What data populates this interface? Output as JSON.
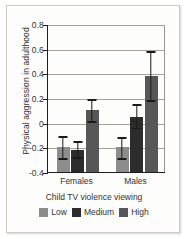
{
  "chart_data": {
    "type": "bar",
    "title": "",
    "xlabel": "Child TV violence viewing",
    "ylabel": "Physical aggression in adulthood",
    "categories": [
      "Females",
      "Males"
    ],
    "ylim": [
      -0.4,
      0.8
    ],
    "yticks": [
      "0.8",
      "0.6",
      "0.4",
      "0.2",
      "0",
      "-0.2",
      "-0.4"
    ],
    "ytick_values": [
      0.8,
      0.6,
      0.4,
      0.2,
      0,
      -0.2,
      -0.4
    ],
    "grid": true,
    "legend_position": "bottom",
    "series": [
      {
        "name": "Low",
        "color": "#8d8d8d",
        "values": [
          -0.2,
          -0.2
        ],
        "err_low": [
          -0.29,
          -0.29
        ],
        "err_high": [
          -0.11,
          -0.12
        ]
      },
      {
        "name": "Medium",
        "color": "#2c2c2c",
        "values": [
          -0.22,
          0.05
        ],
        "err_low": [
          -0.28,
          -0.04
        ],
        "err_high": [
          -0.15,
          0.15
        ]
      },
      {
        "name": "High",
        "color": "#575757",
        "values": [
          0.1,
          0.38
        ],
        "err_low": [
          0.01,
          0.18
        ],
        "err_high": [
          0.19,
          0.58
        ]
      }
    ]
  },
  "legend": {
    "items": [
      {
        "label": "Low"
      },
      {
        "label": "Medium"
      },
      {
        "label": "High"
      }
    ]
  }
}
